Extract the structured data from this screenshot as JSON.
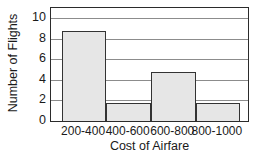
{
  "chart_data": {
    "type": "bar",
    "title": "",
    "subtitle": "",
    "xlabel": "Cost of Airfare",
    "ylabel": "Number of Flights",
    "categories": [
      "200-400",
      "400-600",
      "600-800",
      "800-1000"
    ],
    "values": [
      8.8,
      1.8,
      4.8,
      1.8
    ],
    "series": [
      {
        "name": "Number of Flights",
        "values": [
          8.8,
          1.8,
          4.8,
          1.8
        ]
      }
    ],
    "ylim": [
      0,
      11
    ],
    "xlim": [
      0,
      4
    ],
    "y_ticks": [
      0,
      2,
      4,
      6,
      8,
      10
    ],
    "y_tick_labels": [
      "0",
      "2",
      "4",
      "6",
      "8",
      "10"
    ],
    "grid": true,
    "grid_axis": "y",
    "legend": false,
    "legend_position": "none",
    "bar_fill_color": "#e6e6e6",
    "bar_edge_color": "#333333",
    "grid_color": "#8c8c8c",
    "axis_color": "#2b2b2b",
    "text_color": "#1a1a1a",
    "background_color": "#ffffff",
    "bar_plot_fraction": 0.905,
    "bar_left_fraction": 0.055
  }
}
